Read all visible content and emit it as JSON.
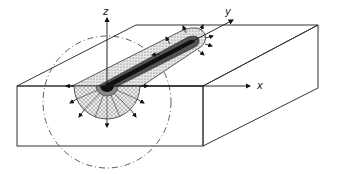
{
  "diagram": {
    "type": "3D heat source in semi-infinite solid",
    "axes": {
      "x": {
        "label": "x"
      },
      "y": {
        "label": "y"
      },
      "z": {
        "label": "z"
      }
    },
    "elements": [
      "rectangular block (solid body)",
      "moving heat source at origin",
      "elongated heat-affected tail along y",
      "semicircular heat flux zone with radial arrows",
      "dash-dot boundary circle"
    ],
    "colors": {
      "line": "#222222",
      "hatch_fill": "#d9d9d9",
      "core": "#111111",
      "ring": "#777777"
    }
  }
}
